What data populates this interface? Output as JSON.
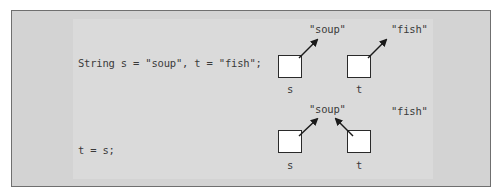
{
  "rows": [
    {
      "code": "String s = \"soup\", t = \"fish\";",
      "strings": [
        "\"soup\"",
        "\"fish\""
      ],
      "vars": [
        "s",
        "t"
      ],
      "pointers": {
        "s": "\"soup\"",
        "t": "\"fish\""
      }
    },
    {
      "code": "t = s;",
      "strings": [
        "\"soup\"",
        "\"fish\""
      ],
      "vars": [
        "s",
        "t"
      ],
      "pointers": {
        "s": "\"soup\"",
        "t": "\"soup\""
      }
    }
  ],
  "colors": {
    "frame": "#d3d3d3",
    "inner": "#dadada",
    "text": "#3a3a3a",
    "box": "#ffffff"
  }
}
